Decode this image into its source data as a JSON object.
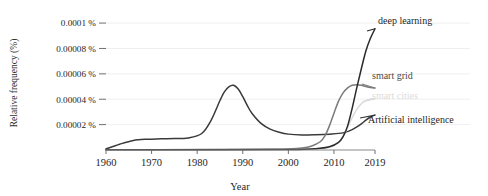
{
  "chart_data": {
    "type": "line",
    "title": "",
    "xlabel": "Year",
    "ylabel": "Relative frequency (%)",
    "xlim": [
      1960,
      2019
    ],
    "ylim": [
      0,
      0.000104
    ],
    "grid": true,
    "legend_position": "inline-right",
    "x_ticks": [
      "1960",
      "1970",
      "1980",
      "1990",
      "2000",
      "2010",
      "2019"
    ],
    "x_tick_values": [
      1960,
      1970,
      1980,
      1990,
      2000,
      2010,
      2019
    ],
    "y_ticks": [
      "0.00002 %",
      "0.00004 %",
      "0.00006 %",
      "0.00008 %",
      "0.0001 %"
    ],
    "y_tick_values": [
      2e-05,
      4e-05,
      6e-05,
      8e-05,
      0.0001
    ],
    "series": [
      {
        "name": "Artificial intelligence",
        "color": "#3a3a3a",
        "label_color": "#1f1f1f",
        "x": [
          1960,
          1963,
          1966,
          1969,
          1972,
          1975,
          1978,
          1981,
          1983,
          1985,
          1986,
          1987,
          1988,
          1989,
          1990,
          1991,
          1992,
          1994,
          1996,
          1998,
          2000,
          2003,
          2006,
          2009,
          2012,
          2014,
          2016,
          2017,
          2018,
          2019
        ],
        "values": [
          8e-07,
          4.5e-06,
          7.5e-06,
          8.5e-06,
          8.8e-06,
          9e-06,
          9.5e-06,
          1.3e-05,
          2.3e-05,
          3.9e-05,
          4.6e-05,
          5e-05,
          5.1e-05,
          4.8e-05,
          4.2e-05,
          3.5e-05,
          2.9e-05,
          2.1e-05,
          1.65e-05,
          1.4e-05,
          1.25e-05,
          1.18e-05,
          1.2e-05,
          1.25e-05,
          1.35e-05,
          1.6e-05,
          2.05e-05,
          2.35e-05,
          2.6e-05,
          2.75e-05
        ]
      },
      {
        "name": "smart grid",
        "color": "#7b7b7b",
        "label_color": "#4a4a4a",
        "x": [
          1960,
          1980,
          1995,
          2000,
          2003,
          2005,
          2007,
          2008,
          2009,
          2010,
          2011,
          2012,
          2013,
          2014,
          2015,
          2016,
          2017,
          2018,
          2019
        ],
        "values": [
          2e-07,
          3e-07,
          5e-07,
          8e-07,
          1.5e-06,
          3e-06,
          6.5e-06,
          1.1e-05,
          1.9e-05,
          2.9e-05,
          3.85e-05,
          4.5e-05,
          4.9e-05,
          5.1e-05,
          5.15e-05,
          5.1e-05,
          5e-05,
          4.92e-05,
          4.88e-05
        ]
      },
      {
        "name": "smart cities",
        "color": "#d8d8d8",
        "label_color": "#dcdcdc",
        "x": [
          1960,
          1985,
          1998,
          2004,
          2007,
          2009,
          2010,
          2011,
          2012,
          2013,
          2014,
          2015,
          2016,
          2017,
          2018,
          2019
        ],
        "values": [
          1e-07,
          2e-07,
          3e-07,
          6e-07,
          1.2e-06,
          2.2e-06,
          3.5e-06,
          6e-06,
          1.05e-05,
          1.75e-05,
          2.55e-05,
          3.2e-05,
          3.65e-05,
          3.9e-05,
          4e-05,
          4.05e-05
        ]
      },
      {
        "name": "deep learning",
        "color": "#2b2b2b",
        "label_color": "#1f1f1f",
        "x": [
          1960,
          1985,
          2000,
          2006,
          2009,
          2011,
          2012,
          2013,
          2014,
          2015,
          2016,
          2017,
          2018,
          2019
        ],
        "values": [
          1e-07,
          2e-07,
          4e-07,
          1e-06,
          2.5e-06,
          6e-06,
          1.05e-05,
          1.9e-05,
          3.3e-05,
          4.9e-05,
          6.4e-05,
          7.8e-05,
          8.8e-05,
          9.55e-05
        ]
      }
    ],
    "annotations": [
      {
        "text": "deep learning",
        "series": "deep learning"
      },
      {
        "text": "smart grid",
        "series": "smart grid"
      },
      {
        "text": "smart cities",
        "series": "smart cities"
      },
      {
        "text": "Artificial intelligence",
        "series": "Artificial intelligence"
      }
    ]
  }
}
